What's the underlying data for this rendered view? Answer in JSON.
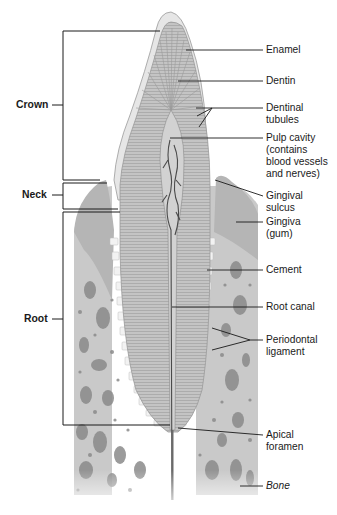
{
  "diagram": {
    "left_labels": {
      "crown": "Crown",
      "neck": "Neck",
      "root": "Root"
    },
    "right_labels": {
      "enamel": "Enamel",
      "dentin": "Dentin",
      "dentinal_tubules_1": "Dentinal",
      "dentinal_tubules_2": "tubules",
      "pulp_cavity_1": "Pulp cavity",
      "pulp_cavity_2": "(contains",
      "pulp_cavity_3": "blood vessels",
      "pulp_cavity_4": "and nerves)",
      "gingival_sulcus_1": "Gingival",
      "gingival_sulcus_2": "sulcus",
      "gingiva_1": "Gingiva",
      "gingiva_2": "(gum)",
      "cement": "Cement",
      "root_canal": "Root canal",
      "periodontal_ligament_1": "Periodontal",
      "periodontal_ligament_2": "ligament",
      "apical_foramen_1": "Apical",
      "apical_foramen_2": "foramen",
      "bone": "Bone"
    },
    "colors": {
      "enamel": "#e6e6e6",
      "dentin": "#c4c4c4",
      "bone": "#c9c9c9",
      "bone_spots": "#8a8a8a",
      "ligament": "#f2f2f2",
      "leader_lines": "#1a1a1a",
      "pulp_vessels": "#4a4a4a"
    }
  }
}
